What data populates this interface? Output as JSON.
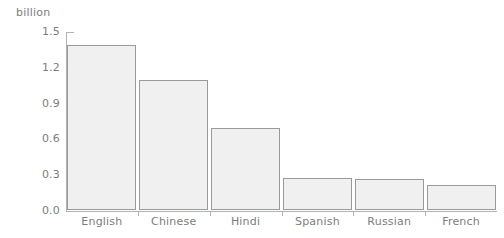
{
  "chart_data": {
    "type": "bar",
    "title": "",
    "subtitle": "",
    "unit_label": "billion",
    "xlabel": "",
    "ylabel": "billion",
    "categories": [
      "English",
      "Chinese",
      "Hindi",
      "Spanish",
      "Russian",
      "French"
    ],
    "values": [
      1.38,
      1.09,
      0.69,
      0.27,
      0.26,
      0.21
    ],
    "ylim": [
      0.0,
      1.5
    ],
    "ytick_labels": [
      "0.0",
      "0.3",
      "0.6",
      "0.9",
      "1.2",
      "1.5"
    ],
    "ytick_values": [
      0.0,
      0.3,
      0.6,
      0.9,
      1.2,
      1.5
    ],
    "grid": false,
    "legend": false,
    "legend_position": "none",
    "annotations": []
  },
  "style": {
    "bar_fill": "#f0f0f0",
    "bar_border": "#9a9a9a",
    "axis_color": "#b2b2b2",
    "text_color": "#7d7d7d",
    "background": "#ffffff"
  }
}
